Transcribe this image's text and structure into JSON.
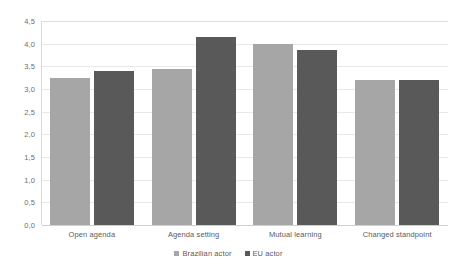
{
  "chart_data": {
    "type": "bar",
    "title": "",
    "subtitle": "",
    "xlabel": "",
    "ylabel": "",
    "categories": [
      "Open agenda",
      "Agenda setting",
      "Mutual learning",
      "Changed standpoint"
    ],
    "series": [
      {
        "name": "Brazilian actor",
        "color": "#a6a6a6",
        "values": [
          3.25,
          3.45,
          4.0,
          3.2
        ]
      },
      {
        "name": "EU actor",
        "color": "#595959",
        "values": [
          3.4,
          4.15,
          3.85,
          3.2
        ]
      }
    ],
    "ylim": [
      0,
      4.5
    ],
    "ytick_step": 0.5,
    "ytick_labels": [
      "4,5",
      "4,0",
      "3,5",
      "3,0",
      "2,5",
      "2,0",
      "1,5",
      "1,0",
      "0,5",
      "0,0"
    ],
    "ytick_values": [
      4.5,
      4.0,
      3.5,
      3.0,
      2.5,
      2.0,
      1.5,
      1.0,
      0.5,
      0.0
    ],
    "grid": true,
    "grid_axis": "y",
    "legend_position": "bottom",
    "decimal_separator": ","
  },
  "legend": {
    "items": [
      {
        "label": "Brazilian actor"
      },
      {
        "label": "EU actor"
      }
    ]
  },
  "colors": {
    "series_brazil": "#a6a6a6",
    "series_eu": "#595959",
    "gridline": "#e8e8e8",
    "axis": "#d9d9d9",
    "text": "#5a5a5a",
    "background": "#ffffff"
  }
}
